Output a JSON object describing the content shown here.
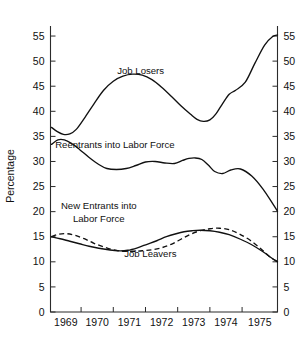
{
  "chart_data": {
    "type": "line",
    "title": "",
    "xlabel": "",
    "ylabel": "Percentage",
    "xlim": [
      1968.55,
      1975.6
    ],
    "ylim": [
      0,
      57
    ],
    "grid": false,
    "legend_position": "inline-annotations",
    "y_ticks": [
      0,
      5,
      10,
      15,
      20,
      25,
      30,
      35,
      40,
      45,
      50,
      55
    ],
    "y_tick_labels": [
      "0",
      "5",
      "10",
      "15",
      "20",
      "25",
      "30",
      "35",
      "40",
      "45",
      "50",
      "55"
    ],
    "y_axis_duplicated_right": true,
    "x_ticks": [
      1968.55,
      1969.5,
      1970.5,
      1971.5,
      1972.5,
      1973.5,
      1974.5,
      1975.6
    ],
    "x_tick_labels": [
      "1969",
      "1970",
      "1971",
      "1972",
      "1973",
      "1974",
      "1975"
    ],
    "x_labels_centered_between_ticks": true,
    "series": [
      {
        "name": "Job Losers",
        "style": "solid",
        "label_x": 1971.35,
        "label_y": 47.5,
        "x": [
          1968.58,
          1968.75,
          1968.95,
          1969.15,
          1969.35,
          1969.6,
          1969.9,
          1970.2,
          1970.5,
          1970.8,
          1971.1,
          1971.4,
          1971.7,
          1972.0,
          1972.3,
          1972.6,
          1972.9,
          1973.1,
          1973.3,
          1973.5,
          1973.7,
          1973.9,
          1974.1,
          1974.3,
          1974.6,
          1974.9,
          1975.2,
          1975.45,
          1975.6
        ],
        "y": [
          36.8,
          36.0,
          35.4,
          35.5,
          36.4,
          38.6,
          41.5,
          44.2,
          46.0,
          47.0,
          47.4,
          47.2,
          46.3,
          44.8,
          43.0,
          41.1,
          39.4,
          38.4,
          38.0,
          38.3,
          39.6,
          41.6,
          43.4,
          44.2,
          45.8,
          49.6,
          53.2,
          54.9,
          55.2
        ]
      },
      {
        "name": "Reentrants into Labor Force",
        "style": "solid",
        "label_x": 1970.55,
        "label_y": 32.6,
        "x": [
          1968.58,
          1968.78,
          1968.98,
          1969.2,
          1969.45,
          1969.75,
          1970.05,
          1970.3,
          1970.6,
          1970.9,
          1971.2,
          1971.5,
          1971.8,
          1972.1,
          1972.4,
          1972.65,
          1972.85,
          1973.05,
          1973.25,
          1973.45,
          1973.65,
          1973.9,
          1974.15,
          1974.45,
          1974.8,
          1975.15,
          1975.45,
          1975.6
        ],
        "y": [
          33.4,
          34.3,
          34.3,
          33.6,
          32.4,
          30.8,
          29.4,
          28.6,
          28.4,
          28.6,
          29.2,
          29.9,
          30.0,
          29.7,
          29.6,
          30.2,
          30.6,
          30.7,
          30.4,
          29.3,
          28.0,
          27.6,
          28.3,
          28.5,
          27.1,
          24.5,
          21.6,
          20.1
        ]
      },
      {
        "name": "New Entrants into Labor Force",
        "style": "dashed",
        "label_x": 1970.05,
        "label_y": 20.5,
        "label_line2_y": 17.9,
        "x": [
          1968.58,
          1968.8,
          1969.05,
          1969.3,
          1969.6,
          1969.9,
          1970.2,
          1970.5,
          1970.8,
          1971.1,
          1971.4,
          1971.7,
          1972.0,
          1972.3,
          1972.6,
          1972.9,
          1973.2,
          1973.5,
          1973.8,
          1974.1,
          1974.4,
          1974.75,
          1975.1,
          1975.4,
          1975.6
        ],
        "y": [
          15.0,
          15.5,
          15.6,
          15.3,
          14.6,
          13.7,
          13.0,
          12.4,
          12.1,
          12.1,
          12.2,
          12.4,
          12.8,
          13.5,
          14.5,
          15.5,
          16.2,
          16.6,
          16.7,
          16.4,
          15.6,
          14.3,
          12.5,
          10.8,
          10.1
        ]
      },
      {
        "name": "Job Leavers",
        "style": "solid",
        "label_x": 1971.65,
        "label_y": 10.9,
        "x": [
          1968.58,
          1968.85,
          1969.15,
          1969.45,
          1969.75,
          1970.05,
          1970.35,
          1970.65,
          1970.95,
          1971.25,
          1971.55,
          1971.85,
          1972.15,
          1972.45,
          1972.7,
          1972.95,
          1973.2,
          1973.5,
          1973.8,
          1974.1,
          1974.45,
          1974.8,
          1975.15,
          1975.45,
          1975.6
        ],
        "y": [
          15.0,
          14.6,
          14.1,
          13.6,
          13.1,
          12.7,
          12.4,
          12.2,
          12.3,
          12.8,
          13.5,
          14.2,
          15.0,
          15.6,
          16.0,
          16.2,
          16.3,
          16.2,
          15.9,
          15.4,
          14.5,
          13.4,
          12.0,
          10.6,
          10.0
        ]
      }
    ],
    "annotations": [
      {
        "id": "job-losers-label",
        "text": "Job Losers"
      },
      {
        "id": "reentrants-label",
        "text": "Reentrants into Labor Force"
      },
      {
        "id": "new-entrants-label-line1",
        "text": "New Entrants into"
      },
      {
        "id": "new-entrants-label-line2",
        "text": "Labor Force"
      },
      {
        "id": "job-leavers-label",
        "text": "Job Leavers"
      }
    ]
  },
  "axis": {
    "y_title": "Percentage",
    "y_ticks": [
      "55",
      "50",
      "45",
      "40",
      "35",
      "30",
      "25",
      "20",
      "15",
      "10",
      "5",
      "0"
    ],
    "x_ticks": [
      "1969",
      "1970",
      "1971",
      "1972",
      "1973",
      "1974",
      "1975"
    ]
  },
  "labels": {
    "job_losers": "Job Losers",
    "reentrants": "Reentrants into Labor Force",
    "new_entrants_line1": "New Entrants into",
    "new_entrants_line2": "Labor Force",
    "job_leavers": "Job Leavers"
  },
  "colors": {
    "line": "#111111",
    "axis": "#2b2b2b",
    "background": "#ffffff"
  }
}
